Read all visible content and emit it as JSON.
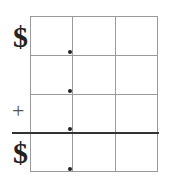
{
  "worksheet": {
    "type": "money addition grid",
    "rows": 4,
    "columns": 3,
    "symbols": {
      "top_dollar": "$",
      "operator": "+",
      "answer_dollar": "$"
    },
    "decimal_points_column": 1,
    "colors": {
      "grid": "#9a9a9a",
      "answer_line": "#333333",
      "ink": "#222222"
    }
  }
}
